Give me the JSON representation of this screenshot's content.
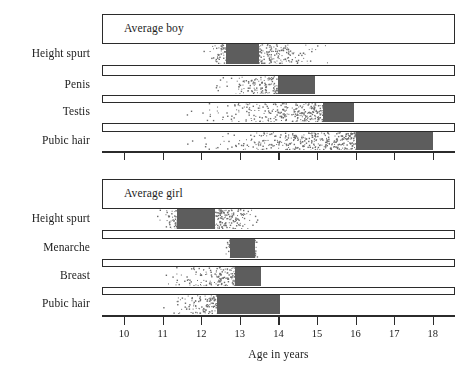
{
  "figure": {
    "axis_title": "Age in years",
    "axis_ticks": [
      10,
      11,
      12,
      13,
      14,
      15,
      16,
      17,
      18
    ],
    "colors": {
      "solid_range": "#5d5d5d",
      "stipple": "#6a6a6a",
      "frame": "#2b2b2b",
      "background": "#ffffff",
      "text": "#1d1d1d"
    }
  },
  "chart_data": {
    "type": "bar",
    "title": "",
    "xlabel": "Age in years",
    "ylabel": "",
    "xlim": [
      9.43,
      18.58
    ],
    "grid": false,
    "legend": null,
    "panels": [
      {
        "name": "Average boy",
        "label": "Average boy",
        "categories": [
          "Height spurt",
          "Penis",
          "Testis",
          "Pubic hair"
        ],
        "series": [
          {
            "name": "Height spurt",
            "stipple_start": 12.0,
            "stipple_end": 15.5,
            "solid_start": 12.65,
            "solid_end": 13.5
          },
          {
            "name": "Penis",
            "stipple_start": 12.0,
            "stipple_end": 14.95,
            "solid_start": 14.0,
            "solid_end": 14.95
          },
          {
            "name": "Testis",
            "stipple_start": 11.35,
            "stipple_end": 15.95,
            "solid_start": 15.15,
            "solid_end": 15.95
          },
          {
            "name": "Pubic hair",
            "stipple_start": 11.25,
            "stipple_end": 18.0,
            "solid_start": 16.0,
            "solid_end": 18.0
          }
        ]
      },
      {
        "name": "Average girl",
        "label": "Average girl",
        "categories": [
          "Height spurt",
          "Menarche",
          "Breast",
          "Pubic hair"
        ],
        "series": [
          {
            "name": "Height spurt",
            "stipple_start": 10.8,
            "stipple_end": 13.7,
            "solid_start": 11.37,
            "solid_end": 12.36
          },
          {
            "name": "Menarche",
            "stipple_start": 12.6,
            "stipple_end": 13.5,
            "solid_start": 12.75,
            "solid_end": 13.4
          },
          {
            "name": "Breast",
            "stipple_start": 10.85,
            "stipple_end": 13.55,
            "solid_start": 12.87,
            "solid_end": 13.55
          },
          {
            "name": "Pubic hair",
            "stipple_start": 10.83,
            "stipple_end": 14.05,
            "solid_start": 12.4,
            "solid_end": 14.05
          }
        ]
      }
    ]
  }
}
